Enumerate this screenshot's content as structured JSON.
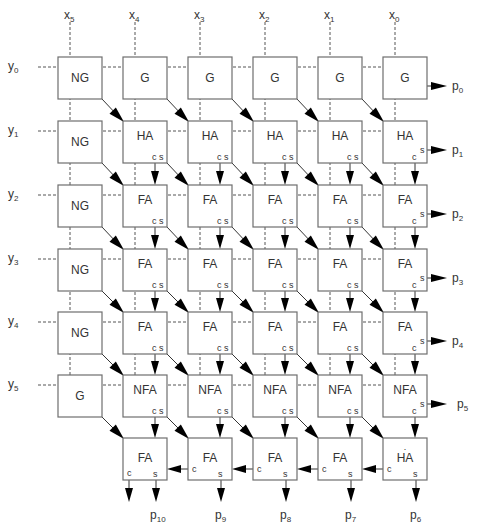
{
  "diagram": {
    "type": "array-multiplier",
    "x_inputs": [
      {
        "name": "x",
        "sub": "5"
      },
      {
        "name": "x",
        "sub": "4"
      },
      {
        "name": "x",
        "sub": "3"
      },
      {
        "name": "x",
        "sub": "2"
      },
      {
        "name": "x",
        "sub": "1"
      },
      {
        "name": "x",
        "sub": "0"
      }
    ],
    "y_inputs": [
      {
        "name": "y",
        "sub": "0"
      },
      {
        "name": "y",
        "sub": "1"
      },
      {
        "name": "y",
        "sub": "2"
      },
      {
        "name": "y",
        "sub": "3"
      },
      {
        "name": "y",
        "sub": "4"
      },
      {
        "name": "y",
        "sub": "5"
      }
    ],
    "rows": [
      [
        "NG",
        "G",
        "G",
        "G",
        "G",
        "G"
      ],
      [
        "NG",
        "HA",
        "HA",
        "HA",
        "HA",
        "HA"
      ],
      [
        "NG",
        "FA",
        "FA",
        "FA",
        "FA",
        "FA"
      ],
      [
        "NG",
        "FA",
        "FA",
        "FA",
        "FA",
        "FA"
      ],
      [
        "NG",
        "FA",
        "FA",
        "FA",
        "FA",
        "FA"
      ],
      [
        "G",
        "NFA",
        "NFA",
        "NFA",
        "NFA",
        "NFA"
      ],
      [
        "",
        "FA",
        "FA",
        "FA",
        "FA",
        "HA*"
      ]
    ],
    "port_labels": {
      "carry": "c",
      "sum": "s",
      "asterisk": "*"
    },
    "outputs_right": [
      {
        "name": "p",
        "sub": "0"
      },
      {
        "name": "p",
        "sub": "1"
      },
      {
        "name": "p",
        "sub": "2"
      },
      {
        "name": "p",
        "sub": "3"
      },
      {
        "name": "p",
        "sub": "4"
      },
      {
        "name": "p",
        "sub": "5"
      }
    ],
    "outputs_bottom": [
      {
        "name": "p",
        "sub": "10"
      },
      {
        "name": "p",
        "sub": "9"
      },
      {
        "name": "p",
        "sub": "8"
      },
      {
        "name": "p",
        "sub": "7"
      },
      {
        "name": "p",
        "sub": "6"
      }
    ]
  }
}
